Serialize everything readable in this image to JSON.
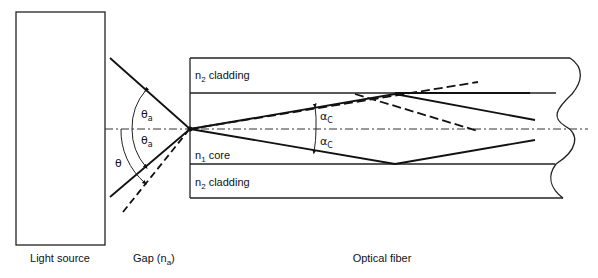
{
  "diagram": {
    "components": {
      "light_source": {
        "label": "Light source"
      },
      "gap": {
        "label_main": "Gap (n",
        "label_sub": "a",
        "label_end": ")"
      },
      "fiber": {
        "label": "Optical fiber"
      }
    },
    "layers": {
      "top_cladding": {
        "n": "n",
        "sub": "2",
        "text": " cladding"
      },
      "core": {
        "n": "n",
        "sub": "1",
        "text": " core"
      },
      "bottom_cladding": {
        "n": "n",
        "sub": "2",
        "text": " cladding"
      }
    },
    "angles": {
      "theta_a_upper": {
        "sym": "θ",
        "sub": "a"
      },
      "theta_a_lower": {
        "sym": "θ",
        "sub": "a"
      },
      "theta": {
        "sym": "θ"
      },
      "alpha_c_upper": {
        "sym": "α",
        "sub": "C"
      },
      "alpha_c_lower": {
        "sym": "α",
        "sub": "C"
      }
    },
    "rays": [
      {
        "name": "incident-upper",
        "style": "solid"
      },
      {
        "name": "incident-lower",
        "style": "solid"
      },
      {
        "name": "incident-beyond-acceptance",
        "style": "dashed"
      },
      {
        "name": "guided-upper",
        "style": "solid"
      },
      {
        "name": "guided-lower",
        "style": "solid"
      },
      {
        "name": "critical-along-interface",
        "style": "solid"
      },
      {
        "name": "refracted-out",
        "style": "dashed"
      },
      {
        "name": "partial-reflection",
        "style": "dashed"
      }
    ]
  }
}
